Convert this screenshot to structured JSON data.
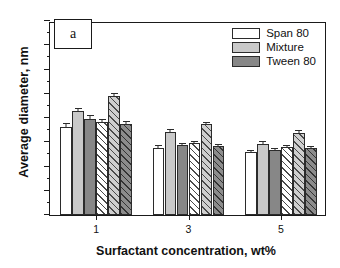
{
  "panel": {
    "label": "a"
  },
  "legend": {
    "items": [
      {
        "label": "Span 80",
        "key": "span",
        "color": "#ffffff"
      },
      {
        "label": "Mixture",
        "key": "mixture",
        "color": "#c9c9c9"
      },
      {
        "label": "Tween 80",
        "key": "tween",
        "color": "#878787"
      }
    ]
  },
  "axes": {
    "ylabel": "Average diameter, nm",
    "xlabel": "Surfactant concentration, wt%",
    "yticks": [
      "0",
      "100",
      "200",
      "300",
      "400",
      "500",
      "600",
      "700",
      "800"
    ],
    "xticks": [
      "1",
      "3",
      "5"
    ]
  },
  "chart_data": {
    "type": "bar",
    "title": "",
    "subtitle": "",
    "xlabel": "Surfactant concentration, wt%",
    "ylabel": "Average diameter, nm",
    "ylim": [
      0,
      800
    ],
    "ytick_interval": 100,
    "yminor_tick_interval": 50,
    "grid": false,
    "legend_position": "top-right",
    "panel_label": "a",
    "categories": [
      "1",
      "3",
      "5"
    ],
    "series": [
      {
        "name": "Span 80",
        "key": "span",
        "fill": "solid",
        "color": "#ffffff",
        "values": [
          363,
          277,
          258
        ],
        "errors": [
          12,
          6,
          5
        ]
      },
      {
        "name": "Mixture",
        "key": "mixture",
        "fill": "solid",
        "color": "#c9c9c9",
        "values": [
          428,
          341,
          293
        ],
        "errors": [
          11,
          8,
          7
        ]
      },
      {
        "name": "Tween 80",
        "key": "tween",
        "fill": "solid",
        "color": "#878787",
        "values": [
          398,
          288,
          268
        ],
        "errors": [
          9,
          6,
          5
        ]
      },
      {
        "name": "Span 80 hatched",
        "key": "span_h",
        "fill": "hatch",
        "color": "#ffffff",
        "values": [
          385,
          296,
          279
        ],
        "errors": [
          7,
          6,
          5
        ]
      },
      {
        "name": "Mixture hatched",
        "key": "mixture_h",
        "fill": "hatch",
        "color": "#cfcfcf",
        "values": [
          492,
          374,
          338
        ],
        "errors": [
          8,
          7,
          7
        ]
      },
      {
        "name": "Tween 80 hatched",
        "key": "tween_h",
        "fill": "hatch",
        "color": "#8c8c8c",
        "values": [
          375,
          285,
          275
        ],
        "errors": [
          7,
          5,
          5
        ]
      }
    ]
  }
}
